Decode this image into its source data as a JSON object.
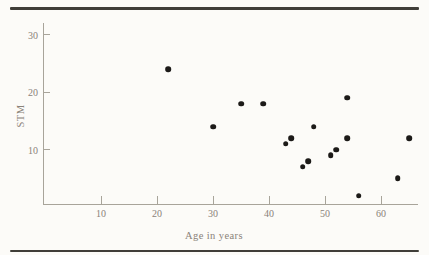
{
  "figure": {
    "colors": {
      "paper": "#fcfbf8",
      "rule": "#403e39",
      "axis": "#a8a49a",
      "text": "#8a8278",
      "dot": "#1c1a18"
    }
  },
  "chart_data": {
    "type": "scatter",
    "title": "",
    "xlabel": "Age in years",
    "ylabel": "STM",
    "xlim": [
      0,
      66.5
    ],
    "ylim": [
      0,
      32
    ],
    "x_ticks": [
      10,
      20,
      30,
      40,
      50,
      60
    ],
    "y_ticks": [
      10,
      20,
      30
    ],
    "grid": false,
    "legend": false,
    "points": [
      {
        "x": 22,
        "y": 24
      },
      {
        "x": 30,
        "y": 14
      },
      {
        "x": 35,
        "y": 18
      },
      {
        "x": 39,
        "y": 18
      },
      {
        "x": 43,
        "y": 11
      },
      {
        "x": 44,
        "y": 12
      },
      {
        "x": 46,
        "y": 7
      },
      {
        "x": 47,
        "y": 8
      },
      {
        "x": 48,
        "y": 14
      },
      {
        "x": 51,
        "y": 9
      },
      {
        "x": 52,
        "y": 10
      },
      {
        "x": 54,
        "y": 19
      },
      {
        "x": 54,
        "y": 12
      },
      {
        "x": 56,
        "y": 2
      },
      {
        "x": 63,
        "y": 5
      },
      {
        "x": 65,
        "y": 12
      }
    ]
  }
}
